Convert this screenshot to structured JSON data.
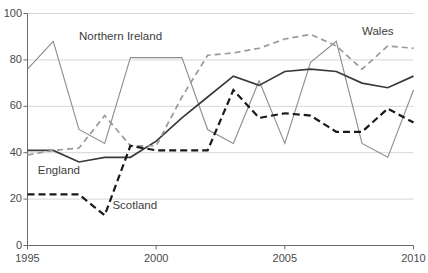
{
  "chart_data": {
    "type": "line",
    "title": "",
    "subtitle": "",
    "xlabel": "",
    "ylabel": "",
    "xlim": [
      1995,
      2010
    ],
    "ylim": [
      0,
      100
    ],
    "grid": true,
    "grid_axis": "y",
    "legend": "inline-labels",
    "legend_position": "inline",
    "x": [
      1995,
      1996,
      1997,
      1998,
      1999,
      2000,
      2001,
      2002,
      2003,
      2004,
      2005,
      2006,
      2007,
      2008,
      2009,
      2010
    ],
    "xticks": [
      1995,
      2000,
      2005,
      2010
    ],
    "xtick_labels": [
      "1995",
      "2000",
      "2005",
      "2010"
    ],
    "yticks": [
      0,
      20,
      40,
      60,
      80,
      100
    ],
    "ytick_labels": [
      "0",
      "20",
      "40",
      "60",
      "80",
      "100"
    ],
    "series": [
      {
        "name": "Northern Ireland",
        "color": "#8c8c8c",
        "style": "solid",
        "width": 1.1,
        "label_x": 1997.0,
        "label_y": 90,
        "values": [
          76,
          88,
          50,
          44,
          81,
          81,
          81,
          50,
          44,
          71,
          44,
          79,
          88,
          44,
          38,
          67
        ]
      },
      {
        "name": "England",
        "color": "#3a3a3a",
        "style": "solid",
        "width": 1.7,
        "label_x": 1995.4,
        "label_y": 32,
        "values": [
          41,
          41,
          36,
          38,
          38,
          45,
          55,
          64,
          73,
          69,
          75,
          76,
          75,
          70,
          68,
          73
        ]
      },
      {
        "name": "Wales",
        "color": "#9a9a9a",
        "style": "dashed",
        "width": 1.7,
        "label_x": 2008.0,
        "label_y": 92,
        "values": [
          39,
          41,
          42,
          56,
          43,
          43,
          64,
          82,
          83,
          85,
          89,
          91,
          86,
          76,
          86,
          85
        ]
      },
      {
        "name": "Scotland",
        "color": "#1a1a1a",
        "style": "dashed",
        "width": 2.2,
        "label_x": 1998.3,
        "label_y": 17,
        "values": [
          22,
          22,
          22,
          13,
          43,
          41,
          41,
          41,
          67,
          55,
          57,
          56,
          49,
          49,
          59,
          53
        ]
      }
    ]
  },
  "axes": {
    "axis_color": "#6b6b6b",
    "grid_color": "#d7d7d7",
    "tick_text_color": "#4a4a4a"
  }
}
